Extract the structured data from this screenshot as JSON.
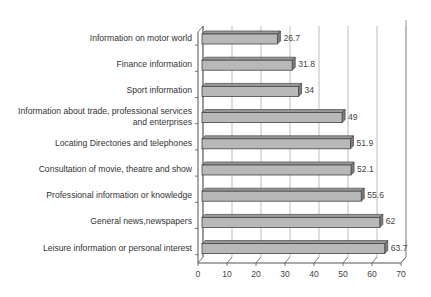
{
  "chart_data": {
    "type": "bar",
    "orientation": "horizontal",
    "style": "3d",
    "title": "",
    "xlabel": "",
    "ylabel": "",
    "categories": [
      "Information on motor world",
      "Finance information",
      "Sport information",
      "Information about trade, professional services and enterprises",
      "Locating Directories and telephones",
      "Consultation of movie, theatre and show",
      "Professional information or knowledge",
      "General news,newspapers",
      "Leisure information or personal interest"
    ],
    "category_lines": [
      [
        "Information on motor world"
      ],
      [
        "Finance information"
      ],
      [
        "Sport information"
      ],
      [
        "Information about trade, professional services",
        "and enterprises"
      ],
      [
        "Locating Directories and telephones"
      ],
      [
        "Consultation of movie, theatre and show"
      ],
      [
        "Professional information or knowledge"
      ],
      [
        "General news,newspapers"
      ],
      [
        "Leisure information or personal interest"
      ]
    ],
    "values": [
      26.7,
      31.8,
      34,
      49,
      51.9,
      52.1,
      55.6,
      62,
      63.7
    ],
    "value_labels": [
      "26.7",
      "31.8",
      "34",
      "49",
      "51.9",
      "52.1",
      "55.6",
      "62",
      "63.7"
    ],
    "xlim": [
      0,
      70
    ],
    "xticks": [
      0,
      10,
      20,
      30,
      40,
      50,
      60,
      70
    ],
    "xtick_labels": [
      "0",
      "10",
      "20",
      "30",
      "40",
      "50",
      "60",
      "70"
    ],
    "grid": true,
    "legend": null,
    "bar_color": "#b8b8b8"
  }
}
